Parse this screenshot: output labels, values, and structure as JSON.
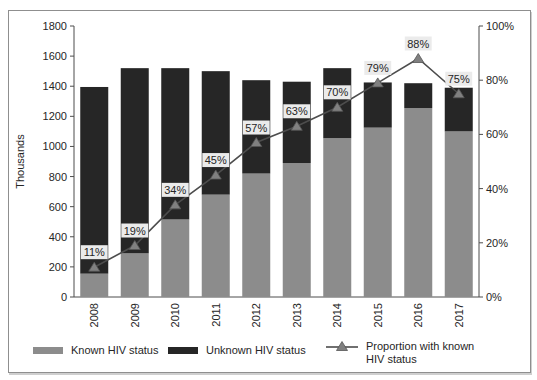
{
  "chart_data": {
    "type": "bar",
    "subtype": "stacked-bars-with-percentage-line",
    "title": "",
    "categories": [
      "2008",
      "2009",
      "2010",
      "2011",
      "2012",
      "2013",
      "2014",
      "2015",
      "2016",
      "2017"
    ],
    "series": [
      {
        "name": "Known HIV status",
        "kind": "bar",
        "stack": "total",
        "color": "#8c8c8c",
        "values": [
          155,
          290,
          515,
          680,
          820,
          890,
          1055,
          1125,
          1255,
          1100
        ]
      },
      {
        "name": "Unknown HIV status",
        "kind": "bar",
        "stack": "total",
        "color": "#262626",
        "values": [
          1240,
          1230,
          1005,
          820,
          620,
          540,
          465,
          300,
          165,
          290
        ]
      },
      {
        "name": "Proportion with known HIV status",
        "kind": "line",
        "axis": "right",
        "color": "#4d4d4d",
        "marker": "triangle",
        "marker_color": "#808080",
        "values": [
          11,
          19,
          34,
          45,
          57,
          63,
          70,
          79,
          88,
          75
        ],
        "labels": [
          "11%",
          "19%",
          "34%",
          "45%",
          "57%",
          "63%",
          "70%",
          "79%",
          "88%",
          "75%"
        ],
        "label_bg": "#ebebeb"
      }
    ],
    "left_axis": {
      "label": "Thousands",
      "min": 0,
      "max": 1800,
      "step": 200,
      "ticks": [
        "0",
        "200",
        "400",
        "600",
        "800",
        "1000",
        "1200",
        "1400",
        "1600",
        "1800"
      ]
    },
    "right_axis": {
      "min": 0,
      "max": 100,
      "step": 20,
      "ticks": [
        "0%",
        "20%",
        "40%",
        "60%",
        "80%",
        "100%"
      ]
    },
    "grid": false,
    "legend_position": "bottom"
  }
}
